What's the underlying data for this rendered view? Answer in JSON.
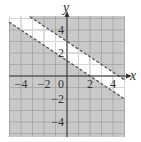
{
  "chart_data": {
    "type": "area",
    "title": "",
    "xlabel": "x",
    "ylabel": "y",
    "xlim": [
      -5,
      5
    ],
    "ylim": [
      -5.3,
      5.2
    ],
    "grid": true,
    "grid_step": 1,
    "x_ticks": [
      -4,
      -2,
      0,
      2,
      4
    ],
    "x_tick_labels": [
      "−4",
      "−2",
      "0",
      "2",
      "4"
    ],
    "y_ticks": [
      4,
      2,
      -2,
      -4
    ],
    "y_tick_labels": [
      "4",
      "2",
      "−2",
      "−4"
    ],
    "boundaries": [
      {
        "name": "upper boundary",
        "equation": "2x + 3y = 9",
        "slope": -0.6667,
        "intercept": 3,
        "style": "dashed"
      },
      {
        "name": "lower boundary",
        "equation": "2x + 3y = 4",
        "slope": -0.6667,
        "intercept": 1.3333,
        "style": "dashed"
      }
    ],
    "solution_region": "unshaded band between lines: 4 < 2x + 3y < 9",
    "shaded_region": "outside the band (above upper line and below lower line)",
    "colors": {
      "shade": "#c9c9c9",
      "grid_on_shade": "#a3a3a3",
      "grid_on_white": "#dcdcdc",
      "axis": "#333333",
      "boundary": "#555555"
    }
  }
}
